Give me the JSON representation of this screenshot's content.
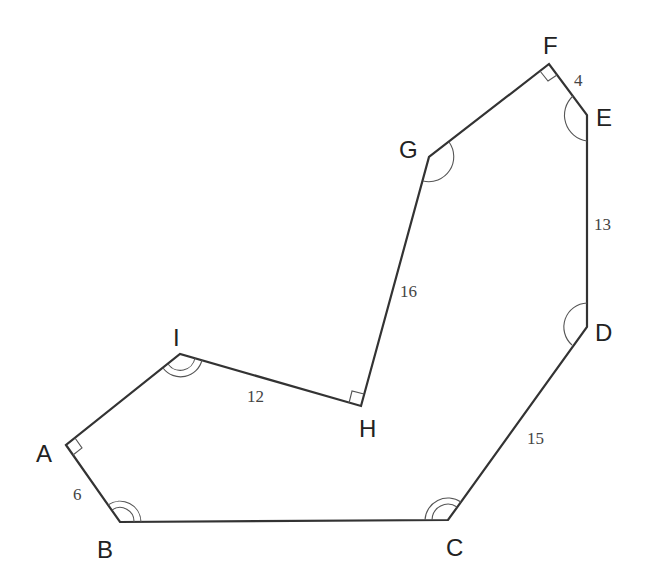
{
  "diagram": {
    "type": "polygon",
    "stroke_color": "#333333",
    "background": "#ffffff",
    "vertices": [
      {
        "name": "A",
        "x": 66,
        "y": 445,
        "label_x": 36,
        "label_y": 462
      },
      {
        "name": "B",
        "x": 120,
        "y": 522,
        "label_x": 97,
        "label_y": 558
      },
      {
        "name": "C",
        "x": 448,
        "y": 520,
        "label_x": 446,
        "label_y": 556
      },
      {
        "name": "D",
        "x": 587,
        "y": 327,
        "label_x": 596,
        "label_y": 340
      },
      {
        "name": "E",
        "x": 587,
        "y": 115,
        "label_x": 596,
        "label_y": 125
      },
      {
        "name": "F",
        "x": 549,
        "y": 64,
        "label_x": 545,
        "label_y": 55
      },
      {
        "name": "G",
        "x": 429,
        "y": 157,
        "label_x": 400,
        "label_y": 157
      },
      {
        "name": "H",
        "x": 361,
        "y": 406,
        "label_x": 360,
        "label_y": 436
      },
      {
        "name": "I",
        "x": 180,
        "y": 354,
        "label_x": 172,
        "label_y": 346
      }
    ],
    "side_lengths": [
      {
        "side": "AB",
        "value": "6",
        "x": 73,
        "y": 498
      },
      {
        "side": "CD",
        "value": "15",
        "x": 527,
        "y": 443
      },
      {
        "side": "DE",
        "value": "13",
        "x": 594,
        "y": 230
      },
      {
        "side": "EF",
        "value": "4",
        "x": 573,
        "y": 85
      },
      {
        "side": "GH",
        "value": "16",
        "x": 400,
        "y": 297
      },
      {
        "side": "HI",
        "value": "12",
        "x": 248,
        "y": 402
      }
    ],
    "right_angles": [
      "A",
      "F",
      "H"
    ],
    "single_arc_angles": [
      "D",
      "E",
      "G"
    ],
    "double_arc_angles": [
      "B",
      "C",
      "I"
    ]
  }
}
